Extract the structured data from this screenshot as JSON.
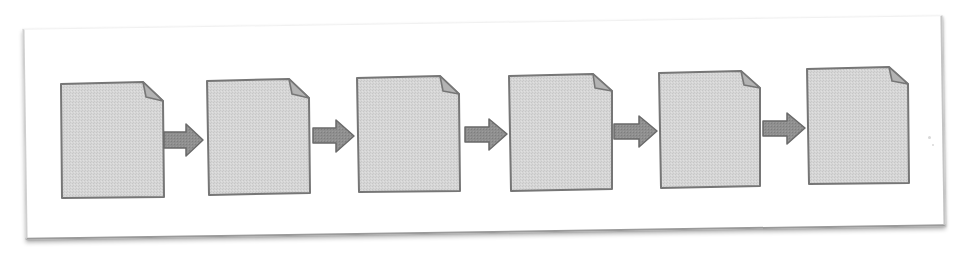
{
  "diagram": {
    "type": "linear-document-flow",
    "colors": {
      "background": "#ffffff",
      "frame_border": "#c4c4c4",
      "frame_shadow": "#9a9a9a",
      "document_fill": "#d4d4d4",
      "document_border": "#777777",
      "fold_fill": "#b3b3b3",
      "arrow_fill": "#8e8e8e",
      "arrow_border": "#6a6a6a"
    },
    "documents": [
      {
        "id": "doc-1",
        "label": ""
      },
      {
        "id": "doc-2",
        "label": ""
      },
      {
        "id": "doc-3",
        "label": ""
      },
      {
        "id": "doc-4",
        "label": ""
      },
      {
        "id": "doc-5",
        "label": ""
      },
      {
        "id": "doc-6",
        "label": ""
      }
    ],
    "connections": [
      {
        "from": "doc-1",
        "to": "doc-2",
        "type": "arrow"
      },
      {
        "from": "doc-2",
        "to": "doc-3",
        "type": "arrow"
      },
      {
        "from": "doc-3",
        "to": "doc-4",
        "type": "arrow"
      },
      {
        "from": "doc-4",
        "to": "doc-5",
        "type": "arrow"
      },
      {
        "from": "doc-5",
        "to": "doc-6",
        "type": "arrow"
      }
    ]
  }
}
